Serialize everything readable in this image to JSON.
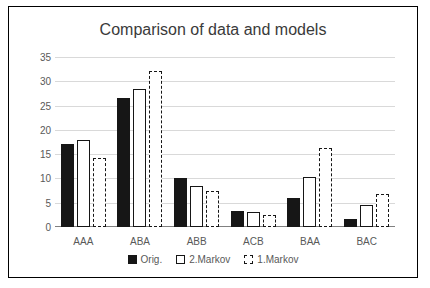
{
  "chart_data": {
    "type": "bar",
    "title": "Comparison of data and models",
    "xlabel": "",
    "ylabel": "",
    "categories": [
      "AAA",
      "ABA",
      "ABB",
      "ACB",
      "BAA",
      "BAC"
    ],
    "series": [
      {
        "name": "Orig.",
        "values": [
          17,
          26.5,
          10,
          3.3,
          6,
          1.7
        ]
      },
      {
        "name": "2.Markov",
        "values": [
          18,
          28.5,
          8.5,
          3,
          10.2,
          4.6
        ]
      },
      {
        "name": "1.Markov",
        "values": [
          14.2,
          32.2,
          7.5,
          2.4,
          16.2,
          6.7
        ]
      }
    ],
    "yticks": [
      0,
      5,
      10,
      15,
      20,
      25,
      30,
      35
    ],
    "ylim": [
      0,
      35
    ],
    "grid": true,
    "legend_position": "bottom"
  },
  "legend": {
    "items": [
      {
        "label": "Orig.",
        "style": "solid-black"
      },
      {
        "label": "2.Markov",
        "style": "white-solid-outline"
      },
      {
        "label": "1.Markov",
        "style": "white-dashed-outline"
      }
    ]
  }
}
